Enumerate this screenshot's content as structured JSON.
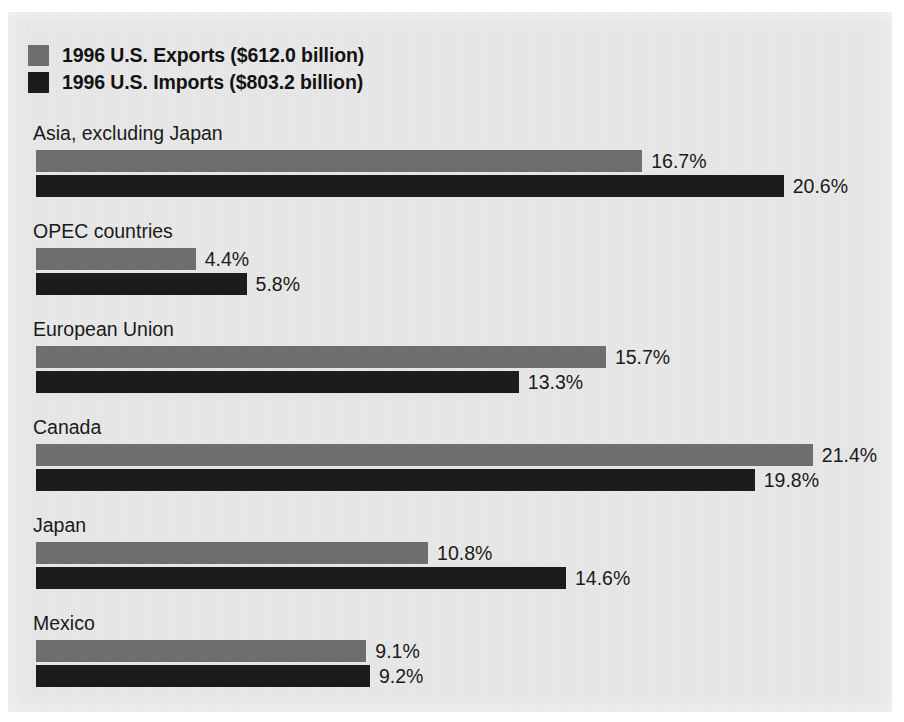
{
  "figure": {
    "background_color": "#e9e9e9"
  },
  "legend": {
    "position": "top-left",
    "entries": [
      {
        "label": "1996 U.S. Exports ($612.0 billion)",
        "swatch": "exports-swatch",
        "color": "#6e6e6e"
      },
      {
        "label": "1996 U.S. Imports ($803.2 billion)",
        "swatch": "imports-swatch",
        "color": "#1c1c1c"
      }
    ]
  },
  "chart_data": {
    "type": "bar",
    "orientation": "horizontal",
    "title": "",
    "subtitle": "",
    "xlabel": "",
    "ylabel": "",
    "xlim": [
      0,
      22
    ],
    "grid": false,
    "legend_position": "top-left",
    "value_suffix": "%",
    "px_per_unit": 36.3,
    "categories": [
      "Asia, excluding Japan",
      "OPEC countries",
      "European Union",
      "Canada",
      "Japan",
      "Mexico"
    ],
    "series": [
      {
        "name": "1996 U.S. Exports ($612.0 billion)",
        "color": "#6e6e6e",
        "total_label": "$612.0 billion",
        "values": [
          16.7,
          4.4,
          15.7,
          21.4,
          10.8,
          9.1
        ],
        "value_labels": [
          "16.7%",
          "4.4%",
          "15.7%",
          "21.4%",
          "10.8%",
          "9.1%"
        ]
      },
      {
        "name": "1996 U.S. Imports ($803.2 billion)",
        "color": "#1c1c1c",
        "total_label": "$803.2 billion",
        "values": [
          20.6,
          5.8,
          13.3,
          19.8,
          14.6,
          9.2
        ],
        "value_labels": [
          "20.6%",
          "5.8%",
          "13.3%",
          "19.8%",
          "14.6%",
          "9.2%"
        ]
      }
    ]
  }
}
